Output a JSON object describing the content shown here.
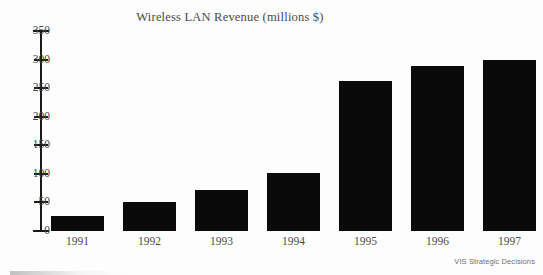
{
  "chart_data": {
    "type": "bar",
    "title": "Wireless LAN Revenue (millions $)",
    "xlabel": "",
    "ylabel": "",
    "categories": [
      "1991",
      "1992",
      "1993",
      "1994",
      "1995",
      "1996",
      "1997"
    ],
    "values": [
      27,
      50,
      72,
      101,
      262,
      288,
      300
    ],
    "ylim": [
      0,
      350
    ],
    "yticks": [
      0,
      50,
      100,
      150,
      200,
      250,
      300,
      350
    ],
    "ytick_labels": [
      "0",
      "50",
      "100",
      "150",
      "200",
      "250",
      "300",
      "350"
    ],
    "grid": false,
    "legend": null,
    "bar_color": "#0a0a0a",
    "axis_color": "#1a1a1a",
    "text_color": "#4a4a4a",
    "background": "#fdfdfd"
  },
  "attribution": {
    "source_label": "VIS Strategic Decisions"
  }
}
